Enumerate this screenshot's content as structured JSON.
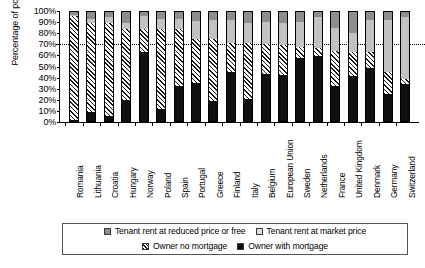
{
  "chart_data": {
    "type": "bar",
    "subtype": "stacked-bar-100-percent",
    "title": "",
    "xlabel": "",
    "ylabel": "Percentage of population",
    "ylim": [
      0,
      100
    ],
    "ytick_labels": [
      "0%",
      "10%",
      "20%",
      "30%",
      "40%",
      "50%",
      "60%",
      "70%",
      "80%",
      "90%",
      "100%"
    ],
    "ytick_values": [
      0,
      10,
      20,
      30,
      40,
      50,
      60,
      70,
      80,
      90,
      100
    ],
    "grid": false,
    "reference_line": {
      "value": 70,
      "style": "dotted",
      "label": ""
    },
    "legend_position": "bottom",
    "categories": [
      "Romania",
      "Lithuania",
      "Croatia",
      "Hungary",
      "Norway",
      "Poland",
      "Spain",
      "Portugal",
      "Greece",
      "Finland",
      "Italy",
      "Belgium",
      "European Union",
      "Sweden",
      "Netherlands",
      "France",
      "United Kingdom",
      "Denmark",
      "Germany",
      "Switzerland"
    ],
    "series": [
      {
        "name": "Owner with mortgage",
        "color": "#101010",
        "pattern": "solid",
        "values": [
          1,
          8,
          5,
          19,
          63,
          11,
          32,
          35,
          18,
          45,
          20,
          43,
          42,
          58,
          60,
          32,
          41,
          49,
          25,
          34
        ]
      },
      {
        "name": "Owner no mortgage",
        "color": "#ffffff",
        "pattern": "diagonal-hatch",
        "values": [
          95,
          82,
          85,
          65,
          21,
          73,
          52,
          40,
          57,
          27,
          52,
          28,
          28,
          10,
          7,
          32,
          22,
          14,
          20,
          5
        ]
      },
      {
        "name": "Tenant rent at market price",
        "color": "#c2c2c2",
        "pattern": "solid-light-gray",
        "values": [
          1,
          4,
          5,
          6,
          12,
          10,
          10,
          17,
          18,
          21,
          18,
          20,
          20,
          23,
          28,
          21,
          18,
          30,
          48,
          56
        ]
      },
      {
        "name": "Tenant rent at reduced price or free",
        "color": "#8d8d8d",
        "pattern": "solid-mid-gray",
        "values": [
          3,
          6,
          5,
          10,
          4,
          6,
          6,
          8,
          7,
          7,
          10,
          9,
          10,
          9,
          5,
          15,
          19,
          7,
          7,
          5
        ]
      }
    ],
    "stack_order_bottom_to_top": [
      "Owner with mortgage",
      "Owner no mortgage",
      "Tenant rent at market price",
      "Tenant rent at reduced price or free"
    ]
  },
  "legend": {
    "row1": [
      {
        "label": "Tenant rent at reduced price or free",
        "swatch": "sw-reduced",
        "icon": "legend-swatch-reduced-rent"
      },
      {
        "label": "Tenant rent at market price",
        "swatch": "sw-market",
        "icon": "legend-swatch-market-rent"
      }
    ],
    "row2": [
      {
        "label": "Owner no mortgage",
        "swatch": "sw-nomort",
        "icon": "legend-swatch-owner-no-mortgage"
      },
      {
        "label": "Owner with mortgage",
        "swatch": "sw-mort",
        "icon": "legend-swatch-owner-with-mortgage"
      }
    ]
  }
}
